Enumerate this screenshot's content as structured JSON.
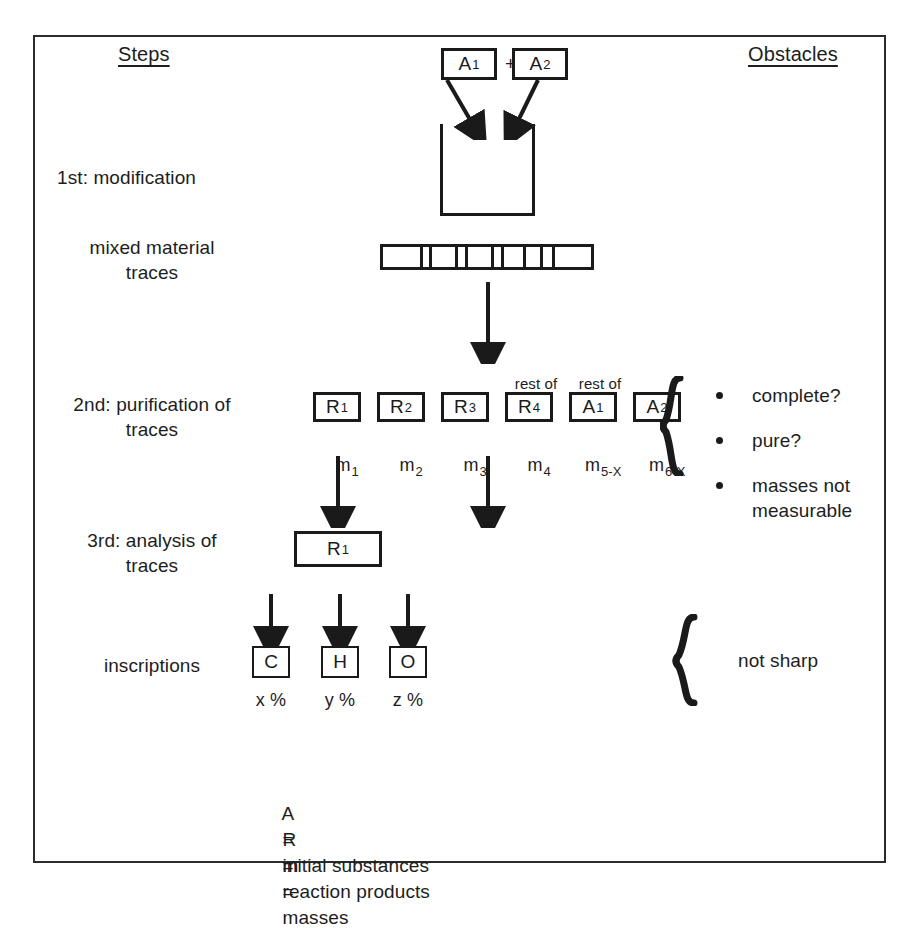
{
  "figure": {
    "columns": {
      "steps_header": "Steps",
      "obstacles_header": "Obstacles"
    },
    "step_labels": [
      {
        "line1": "1st: modification",
        "line2": ""
      },
      {
        "line1": "mixed material",
        "line2": "traces"
      },
      {
        "line1": "2nd: purification of",
        "line2": "traces"
      },
      {
        "line1": "3rd: analysis of",
        "line2": "traces"
      },
      {
        "line1": "inscriptions",
        "line2": ""
      }
    ],
    "inputs": {
      "box1": {
        "symbol": "A",
        "subscript": "1"
      },
      "plus": "+",
      "box2": {
        "symbol": "A",
        "subscript": "2"
      }
    },
    "purification_row": [
      {
        "caption": "",
        "symbol": "R",
        "subscript": "1",
        "mass": "m",
        "mass_subscript": "1"
      },
      {
        "caption": "",
        "symbol": "R",
        "subscript": "2",
        "mass": "m",
        "mass_subscript": "2"
      },
      {
        "caption": "",
        "symbol": "R",
        "subscript": "3",
        "mass": "m",
        "mass_subscript": "3"
      },
      {
        "caption": "",
        "symbol": "R",
        "subscript": "4",
        "mass": "m",
        "mass_subscript": "4"
      },
      {
        "caption": "rest of",
        "symbol": "A",
        "subscript": "1",
        "mass": "m",
        "mass_subscript": "5-X"
      },
      {
        "caption": "rest of",
        "symbol": "A",
        "subscript": "2",
        "mass": "m",
        "mass_subscript": "6-X"
      }
    ],
    "analysis_box": {
      "symbol": "R",
      "subscript": "1"
    },
    "inscriptions_row": [
      {
        "symbol": "C",
        "percent": "x %"
      },
      {
        "symbol": "H",
        "percent": "y %"
      },
      {
        "symbol": "O",
        "percent": "z %"
      }
    ],
    "obstacles": [
      {
        "line1": "complete?",
        "line2": ""
      },
      {
        "line1": "pure?",
        "line2": ""
      },
      {
        "line1": "masses not",
        "line2": "measurable"
      }
    ],
    "obstacle_bottom": "not sharp",
    "brace_glyph": "}",
    "legend": [
      {
        "key": "A",
        "eq": "=",
        "value": "initial substances"
      },
      {
        "key": "R",
        "eq": "=",
        "value": "reaction products"
      },
      {
        "key": "m",
        "eq": "=",
        "value": "masses"
      }
    ],
    "colors": {
      "ink": "#1a1a1a",
      "frame": "#2b2b2b",
      "background": "#ffffff"
    }
  }
}
